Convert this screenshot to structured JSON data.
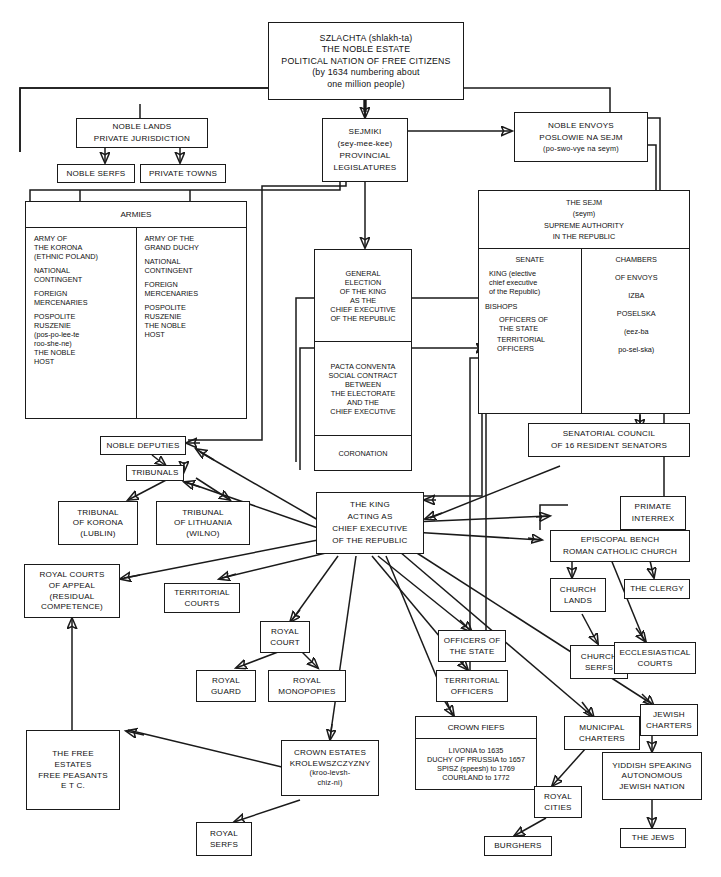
{
  "diagram": {
    "nodes": {
      "szlachta": {
        "l1": "SZLACHTA (shlakh-ta)",
        "l2": "THE NOBLE ESTATE",
        "l3": "POLITICAL NATION OF FREE CITIZENS",
        "l4": "(by 1634 numbering about",
        "l5": "one million people)"
      },
      "noble_lands": {
        "l1": "NOBLE LANDS",
        "l2": "PRIVATE JURISDICTION"
      },
      "noble_serfs": {
        "l1": "NOBLE SERFS"
      },
      "private_towns": {
        "l1": "PRIVATE TOWNS"
      },
      "sejmiki": {
        "l1": "SEJMIKI",
        "l2": "(sey-mee-kee)",
        "l3": "PROVINCIAL",
        "l4": "LEGISLATURES"
      },
      "noble_envoys": {
        "l1": "NOBLE ENVOYS",
        "l2": "POSLOWIE NA SEJM",
        "l3": "(po-swo-vye  na  seym)"
      },
      "armies": {
        "header": "ARMIES",
        "korona": [
          "ARMY OF",
          "THE KORONA",
          "(ETHNIC POLAND)",
          "",
          "NATIONAL",
          "CONTINGENT",
          "",
          "FOREIGN",
          "MERCENARIES",
          "",
          "POSPOLITE",
          "RUSZENIE",
          "(pos-po-lee-te",
          "roo-she-ne)",
          "THE NOBLE",
          "HOST"
        ],
        "duchy": [
          "ARMY OF THE",
          "GRAND DUCHY",
          "",
          "NATIONAL",
          "CONTINGENT",
          "",
          "FOREIGN",
          "MERCENARIES",
          "",
          "POSPOLITE",
          "RUSZENIE",
          "THE NOBLE",
          "HOST"
        ]
      },
      "election": {
        "s1": [
          "GENERAL",
          "ELECTION",
          "OF THE KING",
          "AS THE",
          "CHIEF EXECUTIVE",
          "OF THE REPUBLIC"
        ],
        "s2": [
          "PACTA CONVENTA",
          "SOCIAL CONTRACT",
          "BETWEEN",
          "THE ELECTORATE",
          "AND THE",
          "CHIEF EXECUTIVE"
        ],
        "s3": [
          "CORONATION"
        ]
      },
      "sejm": {
        "header": [
          "THE SEJM",
          "(seym)",
          "SUPREME AUTHORITY",
          "IN THE REPUBLIC"
        ],
        "senate": {
          "title": "SENATE",
          "king": [
            "KING (elective",
            "chief executive",
            "of the Republic)"
          ],
          "bishops": "BISHOPS",
          "officers_state": [
            "OFFICERS OF",
            "THE STATE"
          ],
          "territorial_officers": [
            "TERRITORIAL",
            "OFFICERS"
          ]
        },
        "chambers": [
          "CHAMBERS",
          "OF ENVOYS",
          "IZBA",
          "POSELSKA",
          "(eez-ba",
          "po-sel-ska)"
        ]
      },
      "senatorial_council": {
        "l1": "SENATORIAL COUNCIL",
        "l2": "OF 16 RESIDENT SENATORS"
      },
      "noble_deputies": {
        "l1": "NOBLE DEPUTIES"
      },
      "tribunals": {
        "l1": "TRIBUNALS"
      },
      "tribunal_korona": {
        "l1": "TRIBUNAL",
        "l2": "OF KORONA",
        "l3": "(LUBLIN)"
      },
      "tribunal_lithuania": {
        "l1": "TRIBUNAL",
        "l2": "OF LITHUANIA",
        "l3": "(WILNO)"
      },
      "king_acting": {
        "l1": "THE KING",
        "l2": "ACTING AS",
        "l3": "CHIEF EXECUTIVE",
        "l4": "OF THE REPUBLIC"
      },
      "primate": {
        "l1": "PRIMATE",
        "l2": "INTERREX"
      },
      "episcopal_bench": {
        "l1": "EPISCOPAL BENCH",
        "l2": "ROMAN CATHOLIC CHURCH"
      },
      "church_lands": {
        "l1": "CHURCH",
        "l2": "LANDS"
      },
      "church_serfs": {
        "l1": "CHURCH",
        "l2": "SERFS"
      },
      "the_clergy": {
        "l1": "THE CLERGY"
      },
      "ecclesiastical_courts": {
        "l1": "ECCLESIASTICAL",
        "l2": "COURTS"
      },
      "royal_courts_appeal": {
        "l1": "ROYAL COURTS",
        "l2": "OF APPEAL",
        "l3": "(RESIDUAL",
        "l4": "COMPETENCE)"
      },
      "territorial_courts": {
        "l1": "TERRITORIAL",
        "l2": "COURTS"
      },
      "royal_court": {
        "l1": "ROYAL",
        "l2": "COURT"
      },
      "royal_guard": {
        "l1": "ROYAL",
        "l2": "GUARD"
      },
      "royal_monopolies": {
        "l1": "ROYAL",
        "l2": "MONOPOPIES"
      },
      "officers_of_state": {
        "l1": "OFFICERS OF",
        "l2": "THE STATE"
      },
      "territorial_officers": {
        "l1": "TERRITORIAL",
        "l2": "OFFICERS"
      },
      "free_estates": {
        "l1": "THE FREE",
        "l2": "ESTATES",
        "l3": "FREE PEASANTS",
        "l4": "E T C."
      },
      "crown_estates": {
        "l1": "CROWN ESTATES",
        "l2": "KROLEWSZCZYZNY",
        "l3": "(kroo-levsh-",
        "l4": "chiz-ni)"
      },
      "royal_serfs": {
        "l1": "ROYAL",
        "l2": "SERFS"
      },
      "crown_fiefs": {
        "header": "CROWN FIEFS",
        "items": [
          "LIVONIA  to  1635",
          "DUCHY OF PRUSSIA  to  1657",
          "SPISZ (speesh) to 1769",
          "COURLAND  to  1772"
        ]
      },
      "municipal_charters": {
        "l1": "MUNICIPAL",
        "l2": "CHARTERS"
      },
      "royal_cities": {
        "l1": "ROYAL",
        "l2": "CITIES"
      },
      "burghers": {
        "l1": "BURGHERS"
      },
      "jewish_charters": {
        "l1": "JEWISH",
        "l2": "CHARTERS"
      },
      "yiddish_nation": {
        "l1": "YIDDISH SPEAKING",
        "l2": "AUTONOMOUS",
        "l3": "JEWISH NATION"
      },
      "the_jews": {
        "l1": "THE JEWS"
      }
    },
    "colors": {
      "ink": "#1a1a1a",
      "paper": "#ffffff"
    }
  }
}
